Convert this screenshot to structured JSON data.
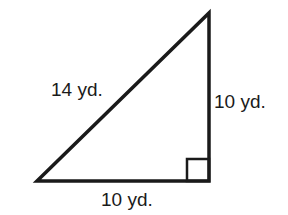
{
  "figure": {
    "type": "right-triangle",
    "hypotenuse_label": "14 yd.",
    "vertical_leg_label": "10 yd.",
    "horizontal_leg_label": "10 yd.",
    "right_angle_marker": true,
    "stroke_color": "#1a1a1a"
  }
}
